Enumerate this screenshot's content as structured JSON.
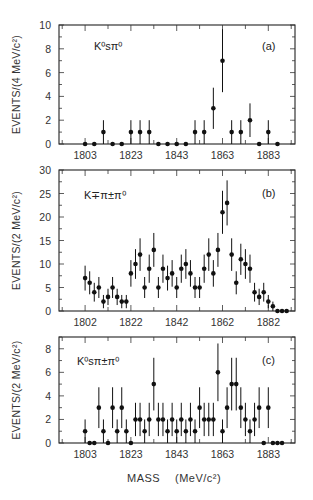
{
  "figure": {
    "xlabel": "MASS",
    "xunit": "(MeV/c²)"
  },
  "chart_data": [
    {
      "type": "scatter",
      "panel": "(a)",
      "title": "K⁰sπ⁰",
      "ylabel": "EVENTS/(4 MeV/c²)",
      "xlabel": "MASS (MeV/c²)",
      "bin_width_MeV": 4,
      "ylim": [
        0,
        10
      ],
      "yticks": [
        0,
        2,
        4,
        6,
        8,
        10
      ],
      "xticks": [
        1803,
        1823,
        1843,
        1863,
        1883
      ],
      "x": [
        1803,
        1807,
        1811,
        1815,
        1819,
        1823,
        1827,
        1831,
        1835,
        1839,
        1843,
        1847,
        1851,
        1855,
        1859,
        1863,
        1867,
        1871,
        1875,
        1879,
        1883,
        1887
      ],
      "values": [
        0,
        0,
        1,
        0,
        0,
        1,
        1,
        1,
        0,
        0,
        0,
        0,
        1,
        1,
        3,
        7,
        1,
        1,
        2,
        0,
        1,
        0
      ],
      "errors": "sqrt(N)",
      "grid": false
    },
    {
      "type": "scatter",
      "panel": "(b)",
      "title": "K∓π±π⁰",
      "ylabel": "EVENTS/(2 MeV/c²)",
      "xlabel": "MASS (MeV/c²)",
      "bin_width_MeV": 2,
      "ylim": [
        0,
        30
      ],
      "yticks": [
        0,
        5,
        10,
        15,
        20,
        25,
        30
      ],
      "xticks": [
        1802,
        1822,
        1842,
        1862,
        1882
      ],
      "x": [
        1802,
        1804,
        1806,
        1808,
        1810,
        1812,
        1814,
        1816,
        1818,
        1820,
        1822,
        1824,
        1826,
        1828,
        1830,
        1832,
        1834,
        1836,
        1838,
        1840,
        1842,
        1844,
        1846,
        1848,
        1850,
        1852,
        1854,
        1856,
        1858,
        1860,
        1862,
        1864,
        1866,
        1868,
        1870,
        1872,
        1874,
        1876,
        1878,
        1880,
        1882,
        1884,
        1886,
        1888,
        1890
      ],
      "values": [
        7,
        6,
        4,
        5,
        2,
        3,
        5,
        3,
        2,
        2,
        8,
        10,
        12,
        5,
        9,
        13,
        5,
        9,
        7,
        8,
        5,
        9,
        10,
        8,
        5,
        5,
        9,
        12,
        8,
        13,
        21,
        23,
        12,
        6,
        11,
        10,
        9,
        4,
        3,
        4,
        2,
        1,
        0,
        0,
        0
      ],
      "errors": "sqrt(N)",
      "grid": false
    },
    {
      "type": "scatter",
      "panel": "(c)",
      "title": "K⁰sπ±π⁰",
      "ylabel": "EVENTS/(2 MeV/c²)",
      "xlabel": "MASS (MeV/c²)",
      "bin_width_MeV": 2,
      "ylim": [
        0,
        9
      ],
      "yticks": [
        0,
        2,
        4,
        6,
        8
      ],
      "xticks": [
        1803,
        1823,
        1843,
        1863,
        1883
      ],
      "x": [
        1803,
        1805,
        1807,
        1809,
        1811,
        1813,
        1815,
        1817,
        1819,
        1821,
        1823,
        1825,
        1827,
        1829,
        1831,
        1833,
        1835,
        1837,
        1839,
        1841,
        1843,
        1845,
        1847,
        1849,
        1851,
        1853,
        1855,
        1857,
        1859,
        1861,
        1863,
        1865,
        1867,
        1869,
        1871,
        1873,
        1875,
        1877,
        1879,
        1881,
        1883,
        1885,
        1887,
        1889
      ],
      "values": [
        1,
        0,
        0,
        3,
        1,
        0,
        3,
        1,
        3,
        1,
        0,
        2,
        2,
        1,
        2,
        5,
        2,
        2,
        1,
        2,
        1,
        2,
        1,
        2,
        1,
        3,
        2,
        2,
        2,
        6,
        1,
        3,
        5,
        5,
        3,
        2,
        1,
        2,
        3,
        0,
        3,
        0,
        0,
        0
      ],
      "errors": "sqrt(N)",
      "grid": false
    }
  ],
  "panels": [
    {
      "id": "a",
      "frame": {
        "x": 59,
        "y": 25,
        "w": 236,
        "h": 119
      },
      "x0": 1791.6,
      "pxPerMeV": 2.29,
      "labelPos": {
        "x": 94,
        "y": 50
      },
      "tagPos": {
        "x": 262,
        "y": 50
      }
    },
    {
      "id": "b",
      "frame": {
        "x": 59,
        "y": 170,
        "w": 236,
        "h": 141
      },
      "x0": 1790.6,
      "pxPerMeV": 2.29,
      "labelPos": {
        "x": 84,
        "y": 199
      },
      "tagPos": {
        "x": 262,
        "y": 197
      }
    },
    {
      "id": "c",
      "frame": {
        "x": 59,
        "y": 337,
        "w": 236,
        "h": 106
      },
      "x0": 1791.6,
      "pxPerMeV": 2.29,
      "labelPos": {
        "x": 77,
        "y": 365
      },
      "tagPos": {
        "x": 262,
        "y": 364
      }
    }
  ],
  "panel_tags": [
    "(a)",
    "(b)",
    "(c)"
  ]
}
